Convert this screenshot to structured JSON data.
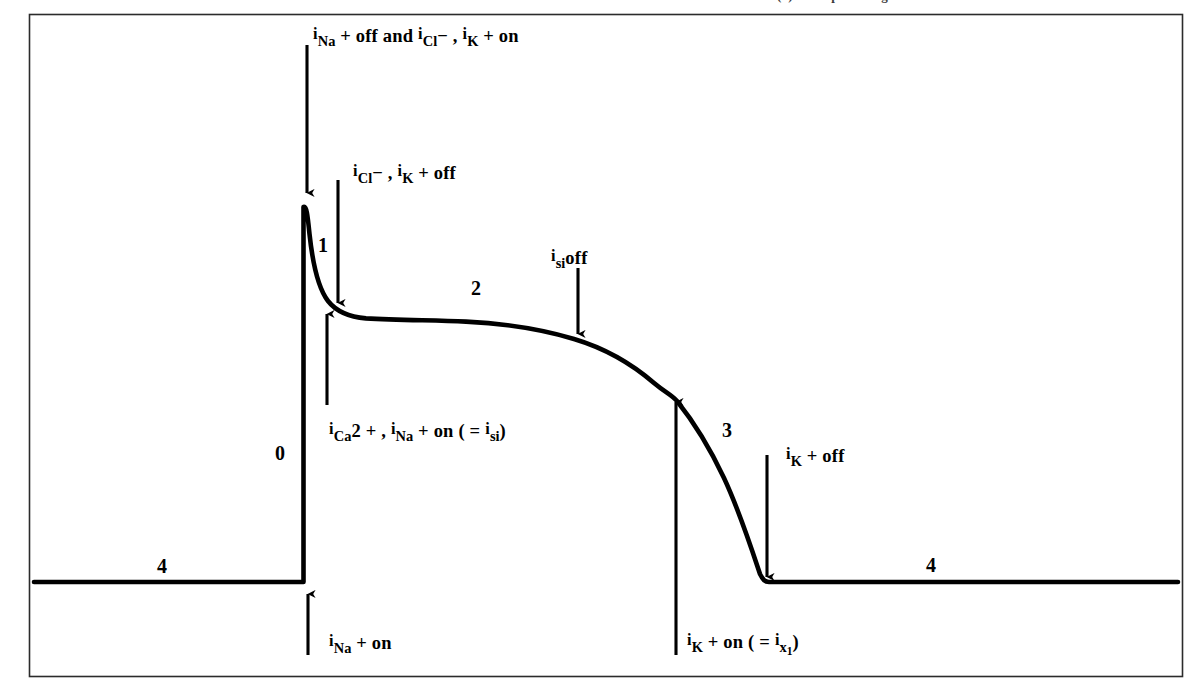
{
  "figure": {
    "type": "cardiac-action-potential-diagram",
    "background_color": "#ffffff",
    "line_color": "#000000",
    "frame": {
      "x": 29,
      "y": 14,
      "width": 1154,
      "height": 663
    },
    "partial_caption_top": "ward current (i   ) and repolarizing"
  },
  "phase_labels": [
    {
      "id": "phase-0",
      "text": "0",
      "x": 275,
      "y": 443
    },
    {
      "id": "phase-1",
      "text": "1",
      "x": 318,
      "y": 235
    },
    {
      "id": "phase-2",
      "text": "2",
      "x": 471,
      "y": 278
    },
    {
      "id": "phase-3",
      "text": "3",
      "x": 722,
      "y": 420
    },
    {
      "id": "phase-4-left",
      "text": "4",
      "x": 157,
      "y": 556
    },
    {
      "id": "phase-4-right",
      "text": "4",
      "x": 926,
      "y": 555
    }
  ],
  "annotations": [
    {
      "id": "ina-off-icl-ik-on",
      "html": "<span class='ipre'>i</span><sub>Na</sub> + off and <span class='ipre'>i</span><sub>Cl</sub>&minus; , <span class='ipre'>i</span><sub>K</sub> + on",
      "plain": "iNa + off and iCl-, iK + on",
      "x": 313,
      "y": 26
    },
    {
      "id": "icl-ik-off",
      "html": "<span class='ipre'>i</span><sub>Cl</sub>&minus; , <span class='ipre'>i</span><sub>K</sub> + off",
      "plain": "iCl-, iK + off",
      "x": 353,
      "y": 163
    },
    {
      "id": "isi-off",
      "html": "<span class='ipre'>i</span><sub>si</sub>off",
      "plain": "isi off",
      "x": 551,
      "y": 248
    },
    {
      "id": "ica-ina-on-isi",
      "html": "<span class='ipre'>i</span><sub>Ca</sub>2 + , <span class='ipre'>i</span><sub>Na</sub> + on ( = <span class='ipre'>i</span><sub>si</sub>)",
      "plain": "iCa2+, iNa + on (=isi)",
      "x": 329,
      "y": 421
    },
    {
      "id": "ik-off-right",
      "html": "<span class='ipre'>i</span><sub>K</sub> + off",
      "plain": "iK + off",
      "x": 786,
      "y": 446
    },
    {
      "id": "ina-on-bottom",
      "html": "<span class='ipre'>i</span><sub>Na</sub> + on",
      "plain": "iNa + on",
      "x": 329,
      "y": 633
    },
    {
      "id": "ik-on-ix1",
      "html": "<span class='ipre'>i</span><sub>K</sub> + on ( = <span class='ipre'>i</span><sub>x<sub>1</sub></sub>)",
      "plain": "iK + on (=ix1)",
      "x": 687,
      "y": 632
    }
  ],
  "arrows": [
    {
      "id": "arrow-ina-off-down",
      "x1": 307,
      "y1": 45,
      "x2": 307,
      "y2": 196,
      "direction": "down"
    },
    {
      "id": "arrow-icl-ik-off-down",
      "x1": 338,
      "y1": 180,
      "x2": 338,
      "y2": 307,
      "direction": "down"
    },
    {
      "id": "arrow-isi-off-down",
      "x1": 578,
      "y1": 268,
      "x2": 578,
      "y2": 338,
      "direction": "down"
    },
    {
      "id": "arrow-ica-ina-on-up",
      "x1": 327,
      "y1": 405,
      "x2": 327,
      "y2": 310,
      "direction": "up"
    },
    {
      "id": "arrow-ik-off-down",
      "x1": 767,
      "y1": 455,
      "x2": 767,
      "y2": 580,
      "direction": "down"
    },
    {
      "id": "arrow-ina-on-up",
      "x1": 308,
      "y1": 655,
      "x2": 308,
      "y2": 590,
      "direction": "up"
    },
    {
      "id": "arrow-ik-on-up",
      "x1": 676,
      "y1": 655,
      "x2": 676,
      "y2": 398,
      "direction": "up"
    }
  ],
  "chart_data": {
    "type": "line",
    "xlabel": "",
    "ylabel": "",
    "grid": false,
    "legend": "none",
    "series": [
      {
        "name": "membrane potential",
        "description": "Phase 4 resting baseline, phase 0 rapid upstroke, phase 1 notch, phase 2 plateau, phase 3 repolarization, phase 4 return to rest",
        "points_px": [
          [
            34,
            582
          ],
          [
            305,
            582
          ],
          [
            305,
            205
          ],
          [
            312,
            250
          ],
          [
            320,
            282
          ],
          [
            332,
            301
          ],
          [
            345,
            312
          ],
          [
            362,
            317
          ],
          [
            400,
            319
          ],
          [
            460,
            320
          ],
          [
            520,
            326
          ],
          [
            570,
            336
          ],
          [
            612,
            352
          ],
          [
            648,
            375
          ],
          [
            675,
            399
          ],
          [
            700,
            432
          ],
          [
            724,
            478
          ],
          [
            748,
            540
          ],
          [
            762,
            578
          ],
          [
            770,
            582
          ],
          [
            1178,
            582
          ]
        ],
        "phases": [
          {
            "phase": "4",
            "segment": "resting baseline left"
          },
          {
            "phase": "0",
            "segment": "rapid depolarization upstroke"
          },
          {
            "phase": "1",
            "segment": "early rapid repolarization notch"
          },
          {
            "phase": "2",
            "segment": "plateau"
          },
          {
            "phase": "3",
            "segment": "final repolarization"
          },
          {
            "phase": "4",
            "segment": "resting baseline right"
          }
        ]
      }
    ]
  }
}
